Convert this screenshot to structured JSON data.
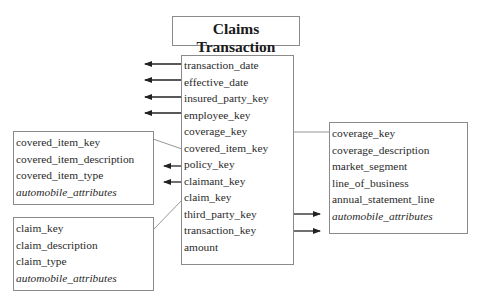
{
  "title": "Claims Transaction",
  "fact_table": {
    "fields": [
      "transaction_date",
      "effective_date",
      "insured_party_key",
      "employee_key",
      "coverage_key",
      "covered_item_key",
      "policy_key",
      "claimant_key",
      "claim_key",
      "third_party_key",
      "transaction_key",
      "amount"
    ]
  },
  "dimensions": {
    "covered_item": {
      "fields": [
        "covered_item_key",
        "covered_item_description",
        "covered_item_type"
      ],
      "italic_field": "automobile_attributes"
    },
    "claim": {
      "fields": [
        "claim_key",
        "claim_description",
        "claim_type"
      ],
      "italic_field": "automobile_attributes"
    },
    "coverage": {
      "fields": [
        "coverage_key",
        "coverage_description",
        "market_segment",
        "line_of_business",
        "annual_statement_line"
      ],
      "italic_field": "automobile_attributes"
    }
  },
  "colors": {
    "border": "#8a8a8a",
    "arrow": "#222222",
    "connector": "#8a8a8a"
  }
}
